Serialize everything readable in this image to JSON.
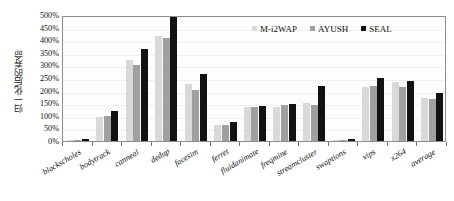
{
  "chart_data": {
    "type": "bar",
    "title": "",
    "xlabel": "",
    "ylabel": "归一化后的寿命",
    "ylim": [
      0,
      500
    ],
    "ytick_step": 50,
    "ytick_labels": [
      "500%",
      "450%",
      "400%",
      "350%",
      "300%",
      "250%",
      "200%",
      "150%",
      "100%",
      "50%",
      "0%"
    ],
    "ytick_values": [
      500,
      450,
      400,
      350,
      300,
      250,
      200,
      150,
      100,
      50,
      0
    ],
    "grid": false,
    "legend_position": "top-right",
    "value_unit": "%",
    "categories": [
      "blackscholes",
      "bodytrack",
      "canneal",
      "dedup",
      "facesim",
      "ferret",
      "fluidanimate",
      "freqmine",
      "streamcluster",
      "swaptions",
      "vips",
      "x264",
      "average"
    ],
    "series": [
      {
        "name": "M-i2WAP",
        "color": "#d9d9d9",
        "values": [
          4,
          95,
          320,
          418,
          225,
          65,
          135,
          133,
          150,
          3,
          215,
          233,
          172
        ]
      },
      {
        "name": "AYUSH",
        "color": "#a0a0a0",
        "values": [
          5,
          100,
          301,
          408,
          203,
          65,
          133,
          143,
          143,
          4,
          217,
          213,
          168
        ]
      },
      {
        "name": "SEAL",
        "color": "#121212",
        "values": [
          8,
          121,
          365,
          500,
          265,
          75,
          140,
          147,
          220,
          8,
          250,
          240,
          190
        ]
      }
    ],
    "annotations": [
      {
        "category": "dedup",
        "series": "SEAL",
        "note": "clipped at axis maximum"
      }
    ]
  },
  "legend": {
    "items": [
      {
        "label": "M-i2WAP",
        "color": "#d9d9d9"
      },
      {
        "label": "AYUSH",
        "color": "#a0a0a0"
      },
      {
        "label": "SEAL",
        "color": "#121212"
      }
    ]
  }
}
